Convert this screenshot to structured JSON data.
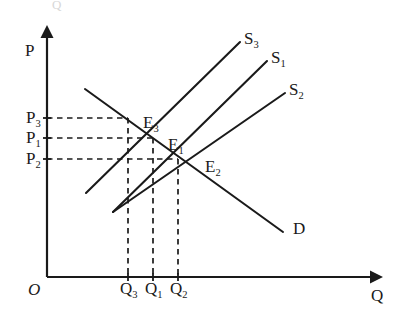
{
  "figure": {
    "ghost_fragment": "Q"
  },
  "axes": {
    "y_label": "P",
    "x_label": "Q",
    "origin_label": "O",
    "origin_px": [
      47,
      277
    ],
    "y_top_px": 32,
    "x_right_px": 378
  },
  "curves": [
    {
      "id": "S3",
      "label": "S",
      "subscript": "3",
      "kind": "supply",
      "label_px": [
        244,
        44
      ],
      "from_px": [
        86,
        193
      ],
      "to_px": [
        240,
        42
      ]
    },
    {
      "id": "S1",
      "label": "S",
      "subscript": "1",
      "kind": "supply",
      "label_px": [
        271,
        63
      ],
      "from_px": [
        113,
        212
      ],
      "to_px": [
        267,
        61
      ]
    },
    {
      "id": "S2",
      "label": "S",
      "subscript": "2",
      "kind": "supply",
      "label_px": [
        289,
        95
      ],
      "from_px": [
        113,
        212
      ],
      "to_px": [
        285,
        93
      ]
    },
    {
      "id": "D",
      "label": "D",
      "subscript": "",
      "kind": "demand",
      "label_px": [
        293,
        234
      ],
      "from_px": [
        85,
        89
      ],
      "to_px": [
        283,
        232
      ]
    }
  ],
  "equilibria": [
    {
      "id": "E3",
      "label": "E",
      "subscript": "3",
      "point_px": [
        128,
        118
      ],
      "label_px": [
        143,
        128
      ],
      "price_label": "P",
      "price_subscript": "3",
      "price_y_px": 118,
      "quantity_label": "Q",
      "quantity_subscript": "3",
      "quantity_x_px": 128
    },
    {
      "id": "E1",
      "label": "E",
      "subscript": "1",
      "point_px": [
        153,
        138
      ],
      "label_px": [
        168,
        150
      ],
      "price_label": "P",
      "price_subscript": "1",
      "price_y_px": 138,
      "quantity_label": "Q",
      "quantity_subscript": "1",
      "quantity_x_px": 153,
      "note": "initial equilibrium"
    },
    {
      "id": "E2",
      "label": "E",
      "subscript": "2",
      "point_px": [
        178,
        159
      ],
      "label_px": [
        205,
        172
      ],
      "price_label": "P",
      "price_subscript": "2",
      "price_y_px": 159,
      "quantity_label": "Q",
      "quantity_subscript": "2",
      "quantity_x_px": 178
    }
  ],
  "price_axis_labels": [
    {
      "base": "P",
      "sub": "3",
      "x_px": 26,
      "y_px": 123
    },
    {
      "base": "P",
      "sub": "1",
      "x_px": 26,
      "y_px": 143
    },
    {
      "base": "P",
      "sub": "2",
      "x_px": 26,
      "y_px": 164
    }
  ],
  "quantity_axis_labels": [
    {
      "base": "Q",
      "sub": "3",
      "x_px": 120,
      "y_px": 294
    },
    {
      "base": "Q",
      "sub": "1",
      "x_px": 145,
      "y_px": 294
    },
    {
      "base": "Q",
      "sub": "2",
      "x_px": 170,
      "y_px": 294
    }
  ],
  "colors": {
    "ink": "#1a1a1a",
    "background": "#ffffff"
  }
}
